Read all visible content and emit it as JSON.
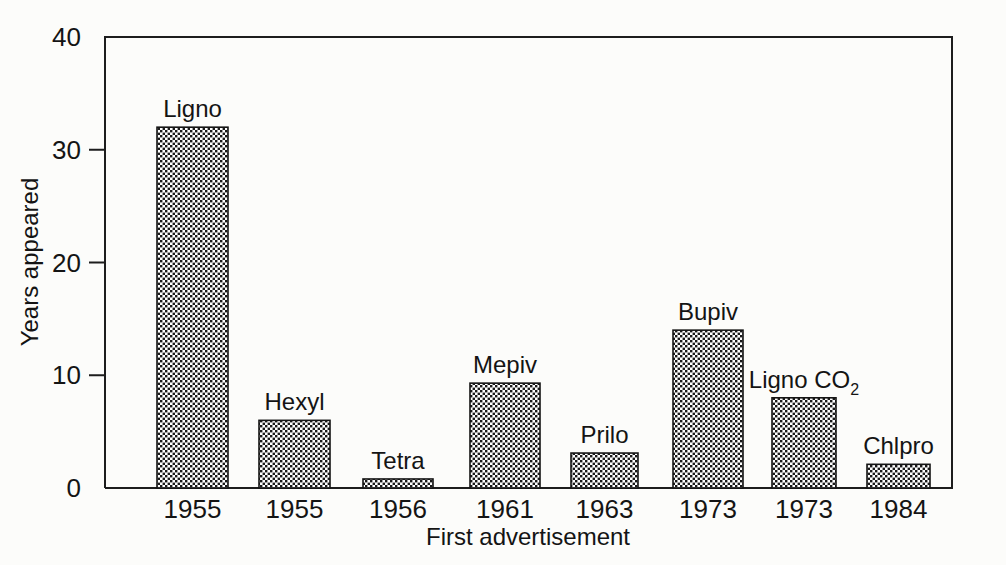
{
  "figure": {
    "background_color": "#fcfcfa",
    "ink_color": "#141414"
  },
  "chart_data": {
    "type": "bar",
    "title": "",
    "subtitle": "",
    "xlabel": "First advertisement",
    "ylabel": "Years appeared",
    "categories": [
      "1955",
      "1955",
      "1956",
      "1961",
      "1963",
      "1973",
      "1973",
      "1984"
    ],
    "bar_labels": [
      "Ligno",
      "Hexyl",
      "Tetra",
      "Mepiv",
      "Prilo",
      "Bupiv",
      "Ligno CO2",
      "Chlpro"
    ],
    "bar_labels_display": [
      "Ligno",
      "Hexyl",
      "Tetra",
      "Mepiv",
      "Prilo",
      "Bupiv",
      "Ligno CO",
      "Chlpro"
    ],
    "bar_label_subscripts": [
      "",
      "",
      "",
      "",
      "",
      "",
      "2",
      ""
    ],
    "values": [
      32,
      6,
      0.8,
      9.3,
      3.1,
      14,
      8,
      2.1
    ],
    "series": [
      {
        "name": "Years appeared",
        "values": [
          32,
          6,
          0.8,
          9.3,
          3.1,
          14,
          8,
          2.1
        ]
      }
    ],
    "ylim": [
      0,
      40
    ],
    "yticks": [
      0,
      10,
      20,
      30,
      40
    ],
    "ytick_labels": [
      "0",
      "10",
      "20",
      "30",
      "40"
    ],
    "xlim": [
      0,
      8
    ],
    "grid": false,
    "legend": false,
    "bar_fill": "dotted-checker-pattern",
    "bar_edge_color": "#151515",
    "axis_frame": "left-top-right-bottom"
  },
  "geometry": {
    "plot_left": 105,
    "plot_right": 952,
    "plot_top": 37,
    "plot_bottom": 488,
    "bar_x": [
      157,
      259,
      363,
      470,
      571,
      673,
      772,
      867
    ],
    "bar_width": [
      71,
      71,
      70,
      70,
      67,
      70,
      64,
      63
    ]
  },
  "axis_titles": {
    "x": "First advertisement",
    "y": "Years appeared"
  }
}
